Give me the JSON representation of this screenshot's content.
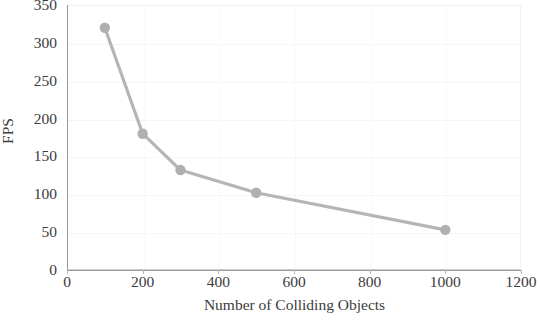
{
  "chart_data": {
    "type": "line",
    "title": "",
    "xlabel": "Number of Colliding Objects",
    "ylabel": "FPS",
    "x": [
      100,
      200,
      300,
      500,
      1000
    ],
    "values": [
      320,
      180,
      132,
      102,
      53
    ],
    "series": [
      {
        "name": "FPS",
        "x": [
          100,
          200,
          300,
          500,
          1000
        ],
        "values": [
          320,
          180,
          132,
          102,
          53
        ]
      }
    ],
    "xlim": [
      0,
      1200
    ],
    "ylim": [
      0,
      350
    ],
    "xticks": [
      "0",
      "200",
      "400",
      "600",
      "800",
      "1000",
      "1200"
    ],
    "xtick_values": [
      0,
      200,
      400,
      600,
      800,
      1000,
      1200
    ],
    "yticks": [
      "0",
      "50",
      "100",
      "150",
      "200",
      "250",
      "300",
      "350"
    ],
    "ytick_values": [
      0,
      50,
      100,
      150,
      200,
      250,
      300,
      350
    ],
    "grid": true,
    "legend": "none",
    "marker": "circle",
    "line_color": "#b5b5b5",
    "marker_color": "#b0b0b0",
    "axis_color": "#9a9a9a",
    "grid_color": "#eeeef0",
    "text_color": "#3c3c3c",
    "background": "#ffffff",
    "annotations": []
  }
}
